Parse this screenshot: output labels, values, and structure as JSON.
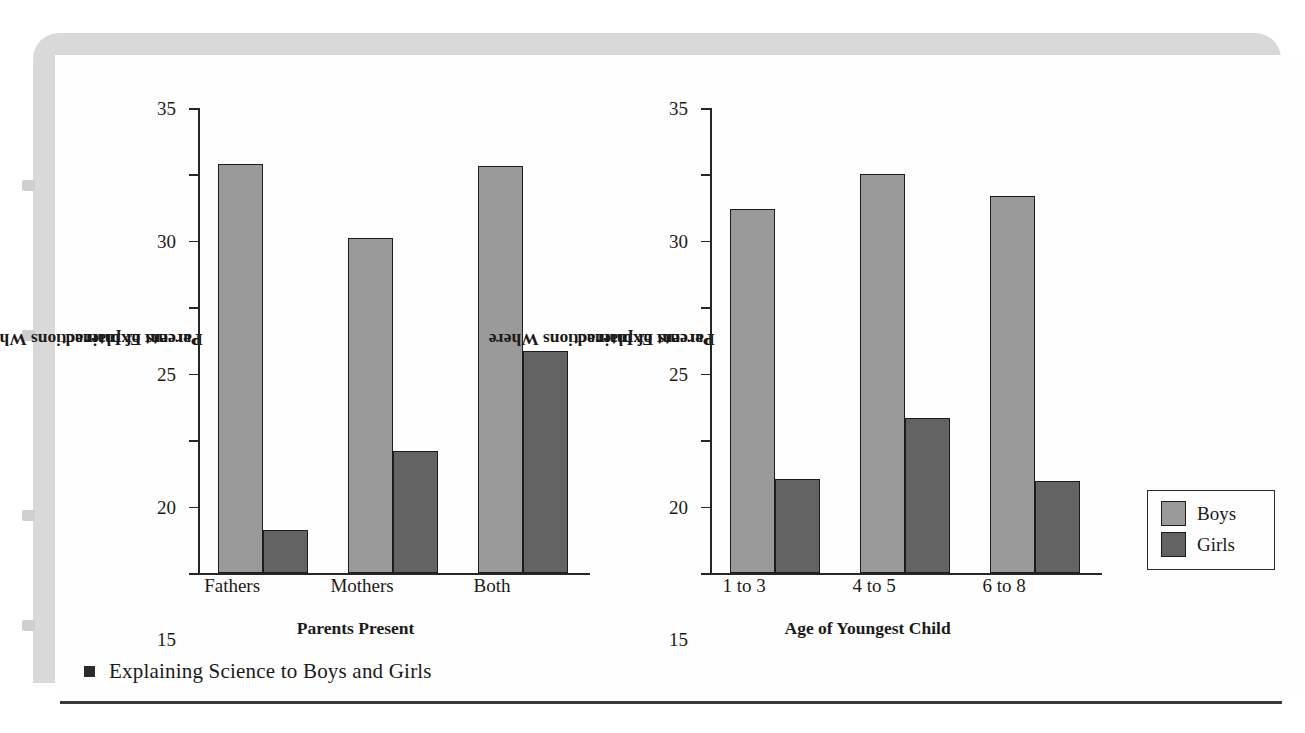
{
  "figure": {
    "caption": "Explaining Science to Boys and Girls",
    "caption_bullet": "square-bullet"
  },
  "legend": {
    "position": "right",
    "entries": [
      {
        "label": "Boys",
        "color": "#9a9a9a"
      },
      {
        "label": "Girls",
        "color": "#636363"
      }
    ]
  },
  "chart_data": [
    {
      "type": "bar",
      "title": "",
      "xlabel": "Parents Present",
      "ylabel": "Percent of Interactions Where Parents Explained",
      "ylabel_line1": "Percent of Interactions Where",
      "ylabel_line2": "Parents Explained",
      "categories": [
        "Fathers",
        "Mothers",
        "Both"
      ],
      "ylim": [
        0,
        35
      ],
      "yticks": [
        0,
        5,
        10,
        15,
        20,
        25,
        30,
        35
      ],
      "grid": false,
      "series": [
        {
          "name": "Boys",
          "color": "#9a9a9a",
          "values": [
            30.8,
            25.2,
            30.6
          ]
        },
        {
          "name": "Girls",
          "color": "#636363",
          "values": [
            3.2,
            9.2,
            16.7
          ]
        }
      ]
    },
    {
      "type": "bar",
      "title": "",
      "xlabel": "Age of Youngest Child",
      "ylabel": "Percent of Interactions Where Parents Explained",
      "ylabel_line1": "Percent of Interactions Where",
      "ylabel_line2": "Parents Explained",
      "categories": [
        "1 to 3",
        "4 to 5",
        "6 to 8"
      ],
      "ylim": [
        0,
        35
      ],
      "yticks": [
        0,
        5,
        10,
        15,
        20,
        25,
        30,
        35
      ],
      "grid": false,
      "series": [
        {
          "name": "Boys",
          "color": "#9a9a9a",
          "values": [
            27.4,
            30.0,
            28.4
          ]
        },
        {
          "name": "Girls",
          "color": "#636363",
          "values": [
            7.1,
            11.7,
            6.9
          ]
        }
      ]
    }
  ]
}
